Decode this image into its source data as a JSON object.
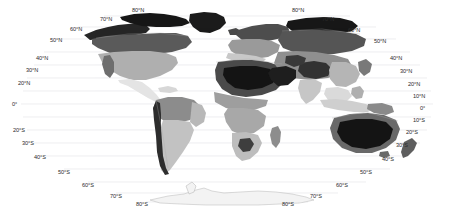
{
  "figure": {
    "kind": "world-map",
    "projection": "robinson-like pseudocylindrical",
    "colormap": "grayscale",
    "background_color": "#ffffff",
    "gridline_color": "#e3e3e6",
    "label_color": "#2b2b2b",
    "ocean_color": "#ffffff",
    "coastline_color": "#9a9a9a"
  },
  "graticule": {
    "parallels_drawn": [
      80,
      70,
      60,
      50,
      40,
      30,
      20,
      10,
      0,
      -10,
      -20,
      -30,
      -40,
      -50,
      -60,
      -70,
      -80
    ]
  },
  "labels": {
    "left": [
      {
        "text": "50°N",
        "x": 50,
        "y": 38
      },
      {
        "text": "40°N",
        "x": 36,
        "y": 56
      },
      {
        "text": "30°N",
        "x": 26,
        "y": 68
      },
      {
        "text": "20°N",
        "x": 18,
        "y": 81
      },
      {
        "text": "0°",
        "x": 12,
        "y": 102
      },
      {
        "text": "20°S",
        "x": 13,
        "y": 128
      },
      {
        "text": "30°S",
        "x": 22,
        "y": 141
      },
      {
        "text": "40°S",
        "x": 34,
        "y": 155
      },
      {
        "text": "50°S",
        "x": 58,
        "y": 170
      },
      {
        "text": "60°S",
        "x": 82,
        "y": 183
      },
      {
        "text": "70°S",
        "x": 110,
        "y": 194
      },
      {
        "text": "80°S",
        "x": 136,
        "y": 202
      }
    ],
    "top_left": [
      {
        "text": "60°N",
        "x": 70,
        "y": 27
      },
      {
        "text": "70°N",
        "x": 100,
        "y": 17
      },
      {
        "text": "80°N",
        "x": 132,
        "y": 8
      }
    ],
    "top_right": [
      {
        "text": "80°N",
        "x": 292,
        "y": 8
      },
      {
        "text": "70°N",
        "x": 322,
        "y": 17
      },
      {
        "text": "60°N",
        "x": 348,
        "y": 28
      }
    ],
    "right": [
      {
        "text": "50°N",
        "x": 374,
        "y": 39
      },
      {
        "text": "40°N",
        "x": 390,
        "y": 56
      },
      {
        "text": "30°N",
        "x": 400,
        "y": 69
      },
      {
        "text": "20°N",
        "x": 408,
        "y": 82
      },
      {
        "text": "10°N",
        "x": 413,
        "y": 94
      },
      {
        "text": "0°",
        "x": 420,
        "y": 106
      },
      {
        "text": "10°S",
        "x": 413,
        "y": 118
      },
      {
        "text": "20°S",
        "x": 406,
        "y": 130
      },
      {
        "text": "30°S",
        "x": 396,
        "y": 143
      },
      {
        "text": "40°S",
        "x": 382,
        "y": 157
      },
      {
        "text": "50°S",
        "x": 360,
        "y": 170
      },
      {
        "text": "60°S",
        "x": 336,
        "y": 183
      },
      {
        "text": "70°S",
        "x": 310,
        "y": 194
      },
      {
        "text": "80°S",
        "x": 282,
        "y": 202
      }
    ]
  },
  "shading_classes": {
    "very_dark": "#1d1d1d",
    "dark": "#3d3d3d",
    "medium_dark": "#616161",
    "medium": "#8a8a8a",
    "light": "#b4b4b4",
    "very_light": "#d4d4d4",
    "near_white": "#ededed"
  },
  "regions": [
    {
      "name": "arctic-canada-greenland",
      "class": "very_dark"
    },
    {
      "name": "northern-siberia",
      "class": "very_dark"
    },
    {
      "name": "sahara-core",
      "class": "very_dark"
    },
    {
      "name": "arabian-peninsula",
      "class": "very_dark"
    },
    {
      "name": "central-australia",
      "class": "very_dark"
    },
    {
      "name": "tibetan-plateau",
      "class": "dark"
    },
    {
      "name": "boreal-canada",
      "class": "medium_dark"
    },
    {
      "name": "boreal-eurasia",
      "class": "medium_dark"
    },
    {
      "name": "central-asia-steppe",
      "class": "medium"
    },
    {
      "name": "contiguous-usa",
      "class": "light"
    },
    {
      "name": "amazon-basin",
      "class": "medium"
    },
    {
      "name": "southern-africa",
      "class": "light"
    },
    {
      "name": "andes",
      "class": "dark"
    },
    {
      "name": "southeast-asia",
      "class": "very_light"
    },
    {
      "name": "central-america",
      "class": "near_white"
    },
    {
      "name": "antarctica",
      "class": "near_white"
    }
  ]
}
